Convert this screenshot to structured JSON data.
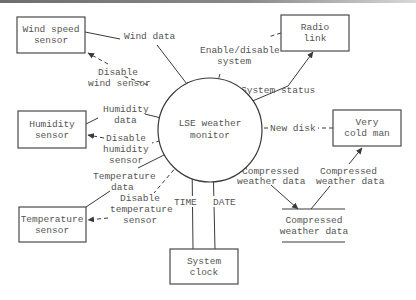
{
  "diagram": {
    "type": "data-flow context diagram",
    "process": {
      "label_lines": [
        "LSE weather",
        "monitor"
      ]
    },
    "entities": [
      {
        "id": "wind",
        "label_lines": [
          "Wind speed",
          "sensor"
        ]
      },
      {
        "id": "radio",
        "label_lines": [
          "Radio",
          "link"
        ]
      },
      {
        "id": "humidity",
        "label_lines": [
          "Humidity",
          "sensor"
        ]
      },
      {
        "id": "coldman",
        "label_lines": [
          "Very",
          "cold man"
        ]
      },
      {
        "id": "temperature",
        "label_lines": [
          "Temperature",
          "sensor"
        ]
      },
      {
        "id": "clock",
        "label_lines": [
          "System",
          "clock"
        ]
      }
    ],
    "data_store": {
      "label_lines": [
        "Compressed",
        "weather data"
      ]
    },
    "flows": [
      {
        "id": "wind_data",
        "label_lines": [
          "Wind data"
        ],
        "from": "wind",
        "to": "process",
        "style": "solid"
      },
      {
        "id": "disable_wind",
        "label_lines": [
          "Disable",
          "wind sensor"
        ],
        "from": "process",
        "to": "wind",
        "style": "dashed"
      },
      {
        "id": "enable_disable",
        "label_lines": [
          "Enable/disable",
          "system"
        ],
        "from": "radio",
        "to": "process",
        "style": "dashed"
      },
      {
        "id": "system_status",
        "label_lines": [
          "System status"
        ],
        "from": "process",
        "to": "radio",
        "style": "solid"
      },
      {
        "id": "humidity_data",
        "label_lines": [
          "Humidity",
          "data"
        ],
        "from": "humidity",
        "to": "process",
        "style": "solid"
      },
      {
        "id": "disable_humidity",
        "label_lines": [
          "Disable",
          "humidity",
          "sensor"
        ],
        "from": "process",
        "to": "humidity",
        "style": "dashed"
      },
      {
        "id": "new_disk",
        "label_lines": [
          "New disk"
        ],
        "from": "coldman",
        "to": "process",
        "style": "dashed"
      },
      {
        "id": "temperature_data",
        "label_lines": [
          "Temperature",
          "data"
        ],
        "from": "temperature",
        "to": "process",
        "style": "solid"
      },
      {
        "id": "disable_temperature",
        "label_lines": [
          "Disable",
          "temperature",
          "sensor"
        ],
        "from": "process",
        "to": "temperature",
        "style": "dashed"
      },
      {
        "id": "time",
        "label_lines": [
          "TIME"
        ],
        "from": "clock",
        "to": "process",
        "style": "solid"
      },
      {
        "id": "date",
        "label_lines": [
          "DATE"
        ],
        "from": "clock",
        "to": "process",
        "style": "solid"
      },
      {
        "id": "compressed_in",
        "label_lines": [
          "Compressed",
          "weather data"
        ],
        "from": "process",
        "to": "store",
        "style": "solid"
      },
      {
        "id": "compressed_out",
        "label_lines": [
          "Compressed",
          "weather data"
        ],
        "from": "store",
        "to": "coldman",
        "style": "solid"
      }
    ]
  }
}
